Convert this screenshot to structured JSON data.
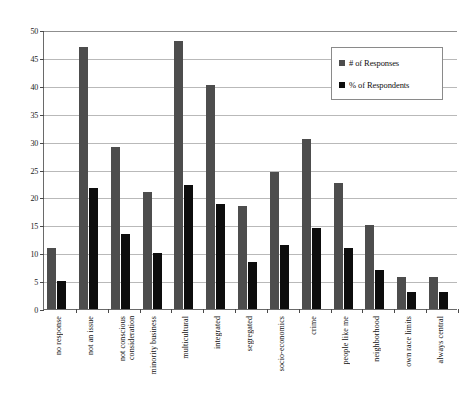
{
  "chart_data": {
    "type": "bar",
    "title": "",
    "xlabel": "",
    "ylabel": "",
    "ylim": [
      0,
      50
    ],
    "yticks": [
      0,
      5,
      10,
      15,
      20,
      25,
      30,
      35,
      40,
      45,
      50
    ],
    "grid": true,
    "legend_position": "upper right",
    "categories": [
      "no response",
      "not an issue",
      "not conscious\nconsideration",
      "minority business",
      "multicultural",
      "integrated",
      "segregated",
      "socio-economics",
      "crime",
      "people like me",
      "neighborhood",
      "own race limits",
      "always central"
    ],
    "series": [
      {
        "name": "# of Responses",
        "color": "#4d4d4d",
        "values": [
          11,
          47,
          29,
          21,
          48,
          40.2,
          18.5,
          24.5,
          30.5,
          22.5,
          15,
          5.8,
          5.8
        ]
      },
      {
        "name": "% of Respondents",
        "color": "#0d0d0d",
        "values": [
          5,
          21.6,
          13.5,
          10,
          22.3,
          18.8,
          8.5,
          11.5,
          14.5,
          11,
          7,
          3,
          3
        ]
      }
    ]
  },
  "legend": {
    "items": [
      {
        "label": "# of Responses",
        "color": "#4d4d4d"
      },
      {
        "label": "% of Respondents",
        "color": "#0d0d0d"
      }
    ]
  },
  "axis": {
    "y_tick_labels": [
      "0",
      "5",
      "10",
      "15",
      "20",
      "25",
      "30",
      "35",
      "40",
      "45",
      "50"
    ]
  }
}
